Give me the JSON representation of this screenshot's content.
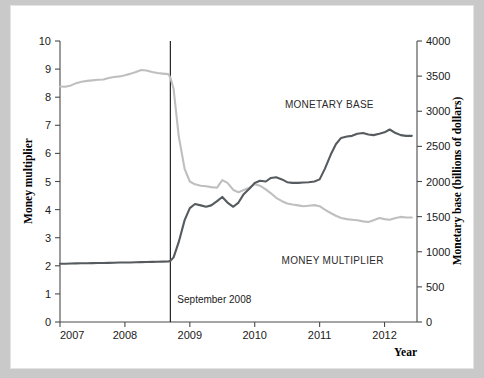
{
  "figure": {
    "background": "#ffffff",
    "page_background": "#c9c9c9"
  },
  "chart_data": {
    "type": "line",
    "title": "",
    "xlabel": "Year",
    "ylabel": "Money multiplier",
    "y2label": "Monetary base (billions of dollars)",
    "xlim": [
      2007.0,
      2012.5
    ],
    "ylim": [
      0,
      10
    ],
    "y2lim": [
      0,
      4000
    ],
    "grid": false,
    "legend_position": "inline-annotation",
    "x_ticks": [
      "2007",
      "2008",
      "2009",
      "2010",
      "2011",
      "2012"
    ],
    "x_tick_values": [
      2007,
      2008,
      2009,
      2010,
      2011,
      2012
    ],
    "y_ticks": [
      "0",
      "1",
      "2",
      "3",
      "4",
      "5",
      "6",
      "7",
      "8",
      "9",
      "10"
    ],
    "y_tick_values": [
      0,
      1,
      2,
      3,
      4,
      5,
      6,
      7,
      8,
      9,
      10
    ],
    "y2_ticks": [
      "0",
      "500",
      "1000",
      "1500",
      "2000",
      "2500",
      "3000",
      "3500",
      "4000"
    ],
    "y2_tick_values": [
      0,
      500,
      1000,
      1500,
      2000,
      2500,
      3000,
      3500,
      4000
    ],
    "annotations": [
      {
        "text": "September 2008",
        "x": 2008.7,
        "type": "vertical-line-label"
      },
      {
        "text": "MONETARY BASE",
        "x": 2011.15,
        "y2": 2850,
        "type": "series-label"
      },
      {
        "text": "MONEY MULTIPLIER",
        "x": 2011.2,
        "y": 2.85,
        "type": "series-label"
      }
    ],
    "event_line_x": 2008.7,
    "series": [
      {
        "name": "MONEY MULTIPLIER",
        "axis": "left",
        "color": "#bfbfbf",
        "x": [
          2007.0,
          2007.08,
          2007.17,
          2007.25,
          2007.33,
          2007.42,
          2007.5,
          2007.58,
          2007.67,
          2007.75,
          2007.83,
          2007.92,
          2008.0,
          2008.08,
          2008.17,
          2008.25,
          2008.33,
          2008.42,
          2008.5,
          2008.58,
          2008.67,
          2008.7,
          2008.75,
          2008.83,
          2008.92,
          2009.0,
          2009.08,
          2009.17,
          2009.25,
          2009.33,
          2009.42,
          2009.5,
          2009.58,
          2009.67,
          2009.75,
          2009.83,
          2009.92,
          2010.0,
          2010.08,
          2010.17,
          2010.25,
          2010.33,
          2010.42,
          2010.5,
          2010.58,
          2010.67,
          2010.75,
          2010.83,
          2010.92,
          2011.0,
          2011.08,
          2011.17,
          2011.25,
          2011.33,
          2011.42,
          2011.5,
          2011.58,
          2011.67,
          2011.75,
          2011.83,
          2011.92,
          2012.0,
          2012.08,
          2012.17,
          2012.25,
          2012.33,
          2012.42
        ],
        "values": [
          8.38,
          8.37,
          8.42,
          8.5,
          8.55,
          8.58,
          8.6,
          8.62,
          8.63,
          8.68,
          8.72,
          8.74,
          8.78,
          8.83,
          8.9,
          8.97,
          8.95,
          8.9,
          8.86,
          8.84,
          8.82,
          8.7,
          8.3,
          6.6,
          5.45,
          5.0,
          4.9,
          4.85,
          4.83,
          4.8,
          4.78,
          5.05,
          4.95,
          4.7,
          4.62,
          4.7,
          4.78,
          4.9,
          4.85,
          4.72,
          4.58,
          4.42,
          4.3,
          4.22,
          4.18,
          4.15,
          4.12,
          4.14,
          4.16,
          4.12,
          4.0,
          3.88,
          3.78,
          3.7,
          3.66,
          3.64,
          3.62,
          3.58,
          3.56,
          3.62,
          3.7,
          3.66,
          3.64,
          3.7,
          3.74,
          3.72,
          3.72
        ]
      },
      {
        "name": "MONETARY BASE",
        "axis": "right",
        "color": "#555b5e",
        "x": [
          2007.0,
          2007.08,
          2007.17,
          2007.25,
          2007.33,
          2007.42,
          2007.5,
          2007.58,
          2007.67,
          2007.75,
          2007.83,
          2007.92,
          2008.0,
          2008.08,
          2008.17,
          2008.25,
          2008.33,
          2008.42,
          2008.5,
          2008.58,
          2008.67,
          2008.7,
          2008.75,
          2008.83,
          2008.92,
          2009.0,
          2009.08,
          2009.17,
          2009.25,
          2009.33,
          2009.42,
          2009.5,
          2009.58,
          2009.67,
          2009.75,
          2009.83,
          2009.92,
          2010.0,
          2010.08,
          2010.17,
          2010.25,
          2010.33,
          2010.42,
          2010.5,
          2010.58,
          2010.67,
          2010.75,
          2010.83,
          2010.92,
          2011.0,
          2011.08,
          2011.17,
          2011.25,
          2011.33,
          2011.42,
          2011.5,
          2011.58,
          2011.67,
          2011.75,
          2011.83,
          2011.92,
          2012.0,
          2012.08,
          2012.17,
          2012.25,
          2012.33,
          2012.42
        ],
        "values": [
          830,
          830,
          832,
          834,
          836,
          836,
          838,
          840,
          840,
          842,
          844,
          846,
          846,
          848,
          850,
          852,
          854,
          856,
          858,
          860,
          862,
          870,
          920,
          1140,
          1450,
          1620,
          1680,
          1660,
          1640,
          1660,
          1720,
          1780,
          1700,
          1640,
          1700,
          1820,
          1900,
          1980,
          2010,
          2000,
          2050,
          2060,
          2030,
          1990,
          1980,
          1980,
          1985,
          1990,
          2000,
          2030,
          2180,
          2380,
          2530,
          2620,
          2640,
          2650,
          2680,
          2690,
          2670,
          2660,
          2680,
          2700,
          2740,
          2690,
          2660,
          2650,
          2650
        ]
      }
    ]
  },
  "labels": {
    "x_axis_title": "Year",
    "y_axis_title": "Money multiplier",
    "y2_axis_title": "Monetary base (billions of dollars)",
    "event_annotation": "September 2008",
    "series_base_label": "MONETARY BASE",
    "series_mm_label": "MONEY MULTIPLIER"
  }
}
